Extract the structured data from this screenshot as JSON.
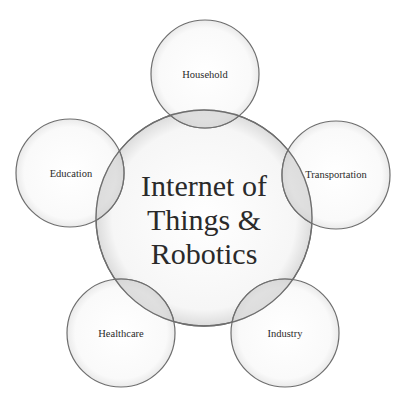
{
  "diagram": {
    "center": {
      "line1": "Internet of",
      "line2": "Things &",
      "line3": "Robotics"
    },
    "nodes": [
      {
        "label": "Household"
      },
      {
        "label": "Education"
      },
      {
        "label": "Transportation"
      },
      {
        "label": "Healthcare"
      },
      {
        "label": "Industry"
      }
    ]
  },
  "colors": {
    "stroke": "#6e6e6e",
    "fill": "#f4f4f4",
    "overlap": "#d6d6d6",
    "text": "#2a2a2a"
  }
}
